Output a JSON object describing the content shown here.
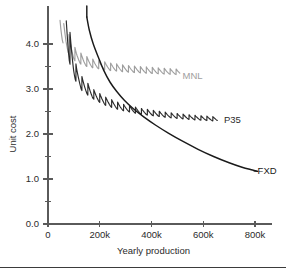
{
  "chart_data": {
    "type": "line",
    "title": "",
    "xlabel": "Yearly production",
    "ylabel": "Unit cost",
    "xlim": [
      0,
      850000
    ],
    "ylim": [
      0.0,
      4.6
    ],
    "grid": false,
    "legend_position": "inline-right-of-series-end",
    "x_ticks": [
      {
        "value": 0,
        "label": "0"
      },
      {
        "value": 200000,
        "label": "200k"
      },
      {
        "value": 400000,
        "label": "400k"
      },
      {
        "value": 600000,
        "label": "600k"
      },
      {
        "value": 800000,
        "label": "800k"
      }
    ],
    "y_ticks": [
      {
        "value": 0.0,
        "label": "0.0",
        "major": true
      },
      {
        "value": 0.5,
        "label": "",
        "major": false
      },
      {
        "value": 1.0,
        "label": "1.0",
        "major": true
      },
      {
        "value": 1.5,
        "label": "",
        "major": false
      },
      {
        "value": 2.0,
        "label": "2.0",
        "major": true
      },
      {
        "value": 2.5,
        "label": "",
        "major": false
      },
      {
        "value": 3.0,
        "label": "3.0",
        "major": true
      },
      {
        "value": 3.5,
        "label": "",
        "major": false
      },
      {
        "value": 4.0,
        "label": "4.0",
        "major": true
      }
    ],
    "series": [
      {
        "name": "MNL",
        "label": "MNL",
        "color": "#9e9e9e",
        "style": "sawtooth-decay",
        "label_x": 520000,
        "label_y": 3.3,
        "description": "Sawtooth cost curve: envelope decays from above 4.6 to ~3.35; teeth drop then jump up at each batch boundary.",
        "x_start": 12000,
        "x_end": 510000,
        "batch_size": 23000,
        "envelope_lower": [
          {
            "x": 12000,
            "y": 4.6
          },
          {
            "x": 30000,
            "y": 4.6
          },
          {
            "x": 50000,
            "y": 4.1
          },
          {
            "x": 70000,
            "y": 3.82
          },
          {
            "x": 100000,
            "y": 3.62
          },
          {
            "x": 140000,
            "y": 3.5
          },
          {
            "x": 180000,
            "y": 3.45
          },
          {
            "x": 240000,
            "y": 3.4
          },
          {
            "x": 320000,
            "y": 3.36
          },
          {
            "x": 420000,
            "y": 3.33
          },
          {
            "x": 510000,
            "y": 3.31
          }
        ],
        "tooth_amplitude": [
          {
            "x": 12000,
            "a": 1.2
          },
          {
            "x": 60000,
            "a": 0.6
          },
          {
            "x": 110000,
            "a": 0.28
          },
          {
            "x": 180000,
            "a": 0.2
          },
          {
            "x": 300000,
            "a": 0.16
          },
          {
            "x": 510000,
            "a": 0.13
          }
        ]
      },
      {
        "name": "P35",
        "label": "P35",
        "color": "#2b2b2b",
        "style": "sawtooth-decay",
        "label_x": 680000,
        "label_y": 2.33,
        "description": "Sawtooth cost curve below MNL: envelope decays from above 4.6 to ~2.33 at 660k.",
        "x_start": 62000,
        "x_end": 655000,
        "batch_size": 23000,
        "envelope_lower": [
          {
            "x": 62000,
            "y": 4.3
          },
          {
            "x": 80000,
            "y": 3.6
          },
          {
            "x": 100000,
            "y": 3.22
          },
          {
            "x": 130000,
            "y": 2.95
          },
          {
            "x": 170000,
            "y": 2.78
          },
          {
            "x": 220000,
            "y": 2.63
          },
          {
            "x": 280000,
            "y": 2.52
          },
          {
            "x": 360000,
            "y": 2.43
          },
          {
            "x": 460000,
            "y": 2.36
          },
          {
            "x": 560000,
            "y": 2.31
          },
          {
            "x": 655000,
            "y": 2.28
          }
        ],
        "tooth_amplitude": [
          {
            "x": 62000,
            "a": 1.1
          },
          {
            "x": 110000,
            "a": 0.38
          },
          {
            "x": 180000,
            "a": 0.22
          },
          {
            "x": 300000,
            "a": 0.15
          },
          {
            "x": 460000,
            "a": 0.12
          },
          {
            "x": 655000,
            "a": 0.1
          }
        ]
      },
      {
        "name": "FXD",
        "label": "FXD",
        "color": "#1a1a1a",
        "style": "smooth-hyperbolic",
        "label_x": 810000,
        "label_y": 1.18,
        "description": "Smooth monotonically decreasing hyperbolic curve, crosses P35 near 360k and MNL near 260k.",
        "points": [
          {
            "x": 150000,
            "y": 4.6
          },
          {
            "x": 160000,
            "y": 4.3
          },
          {
            "x": 175000,
            "y": 4.0
          },
          {
            "x": 195000,
            "y": 3.7
          },
          {
            "x": 215000,
            "y": 3.42
          },
          {
            "x": 240000,
            "y": 3.15
          },
          {
            "x": 265000,
            "y": 2.95
          },
          {
            "x": 295000,
            "y": 2.75
          },
          {
            "x": 330000,
            "y": 2.56
          },
          {
            "x": 370000,
            "y": 2.38
          },
          {
            "x": 415000,
            "y": 2.2
          },
          {
            "x": 465000,
            "y": 2.02
          },
          {
            "x": 520000,
            "y": 1.84
          },
          {
            "x": 580000,
            "y": 1.66
          },
          {
            "x": 640000,
            "y": 1.5
          },
          {
            "x": 700000,
            "y": 1.36
          },
          {
            "x": 750000,
            "y": 1.26
          },
          {
            "x": 790000,
            "y": 1.2
          },
          {
            "x": 810000,
            "y": 1.17
          }
        ]
      }
    ]
  },
  "figure": {
    "bottom_rule": true
  }
}
